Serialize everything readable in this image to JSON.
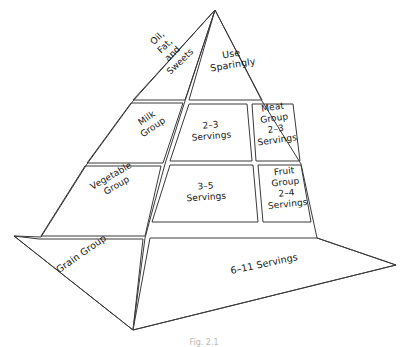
{
  "figure": {
    "name": "food-guide-pyramid",
    "caption": "Fig. 2.1",
    "stroke_color": "#3a3a3a",
    "fill_color": "#ffffff",
    "text_color": "#161616"
  },
  "tiers": [
    {
      "level": 1,
      "name": "apex",
      "left_face": {
        "label": "Oil,\nFat,\nand\nSweets"
      },
      "front_center": {
        "label": "Use\nSparingly"
      },
      "front_right": {
        "label": ""
      }
    },
    {
      "level": 2,
      "name": "milk-meat",
      "left_face": {
        "label": "Milk\nGroup"
      },
      "front_center": {
        "label": "2–3\nServings"
      },
      "front_right": {
        "label": "Meat\nGroup\n2–3\nServings"
      }
    },
    {
      "level": 3,
      "name": "vegetable-fruit",
      "left_face": {
        "label": "Vegetable\nGroup"
      },
      "front_center": {
        "label": "3–5\nServings"
      },
      "front_right": {
        "label": "Fruit\nGroup\n2–4\nServings"
      }
    },
    {
      "level": 4,
      "name": "grain-base",
      "left_face": {
        "label": "Grain Group"
      },
      "front_center": {
        "label": "6–11 Servings"
      },
      "front_right": {
        "label": ""
      }
    }
  ]
}
